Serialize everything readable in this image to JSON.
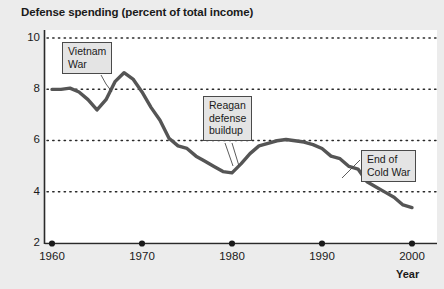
{
  "chart_data": {
    "type": "line",
    "title": "Defense spending (percent of total income)",
    "xlabel": "Year",
    "ylabel": "",
    "xlim": [
      1958,
      2002
    ],
    "ylim": [
      2,
      10
    ],
    "grid": true,
    "grid_style": "dotted-horizontal",
    "legend": "none",
    "xticks": [
      1960,
      1970,
      1980,
      1990,
      2000
    ],
    "xtick_labels": [
      "1960",
      "1970",
      "1980",
      "1990",
      "2000"
    ],
    "yticks": [
      2,
      4,
      6,
      8,
      10
    ],
    "ytick_labels": [
      "2",
      "4",
      "6",
      "8",
      "10"
    ],
    "series": [
      {
        "name": "Defense spending",
        "color": "#555555",
        "x": [
          1960,
          1961,
          1962,
          1963,
          1964,
          1965,
          1966,
          1967,
          1968,
          1969,
          1970,
          1971,
          1972,
          1973,
          1974,
          1975,
          1976,
          1977,
          1978,
          1979,
          1980,
          1981,
          1982,
          1983,
          1984,
          1985,
          1986,
          1987,
          1988,
          1989,
          1990,
          1991,
          1992,
          1993,
          1994,
          1995,
          1996,
          1997,
          1998,
          1999,
          2000
        ],
        "values": [
          8.0,
          8.0,
          8.05,
          7.9,
          7.6,
          7.2,
          7.6,
          8.3,
          8.65,
          8.4,
          7.9,
          7.3,
          6.8,
          6.1,
          5.8,
          5.7,
          5.4,
          5.2,
          5.0,
          4.8,
          4.75,
          5.1,
          5.5,
          5.8,
          5.9,
          6.0,
          6.05,
          6.0,
          5.95,
          5.85,
          5.7,
          5.4,
          5.3,
          5.0,
          4.9,
          4.4,
          4.2,
          4.0,
          3.8,
          3.5,
          3.4
        ]
      }
    ],
    "annotations": [
      {
        "id": "vietnam",
        "text": "Vietnam\nWar",
        "pointer_to_year": 1966,
        "pointer_to_value": 7.5
      },
      {
        "id": "reagan",
        "text": "Reagan\ndefense\nbuildup",
        "pointer_to_year": 1980,
        "pointer_to_value": 4.8
      },
      {
        "id": "coldwar",
        "text": "End of\nCold War",
        "pointer_to_year": 1992,
        "pointer_to_value": 5.3
      }
    ]
  },
  "figure": {
    "title": "Defense spending (percent of total income)",
    "xaxis_title": "Year",
    "ytick_labels": {
      "t10": "10",
      "t8": "8",
      "t6": "6",
      "t4": "4",
      "t2": "2"
    },
    "xtick_labels": {
      "t1960": "1960",
      "t1970": "1970",
      "t1980": "1980",
      "t1990": "1990",
      "t2000": "2000"
    },
    "annotations": {
      "vietnam": "Vietnam\nWar",
      "reagan": "Reagan\ndefense\nbuildup",
      "coldwar": "End of\nCold War"
    },
    "colors": {
      "line": "#555555",
      "grid": "#2a2a2a",
      "axis": "#2a2a2a",
      "annotation_bg": "#e4e4e4",
      "annotation_border": "#4a4a4a",
      "plot_bg": "#ffffff",
      "figure_bg": "#ececec"
    }
  }
}
